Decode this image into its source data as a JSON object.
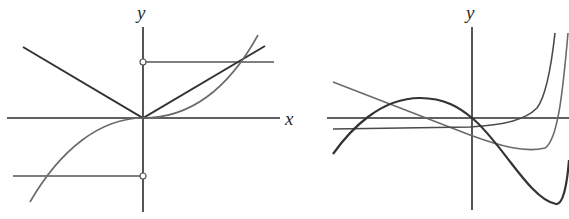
{
  "figures": [
    {
      "id": "left",
      "axis_labels": {
        "x": "x",
        "y": "y"
      },
      "curves": [
        {
          "name": "absolute-value",
          "description": "V-shaped graph with vertex at origin"
        },
        {
          "name": "cubic",
          "description": "increasing cubic through origin"
        },
        {
          "name": "step-upper",
          "description": "horizontal segment with open circle on y-axis, positive side"
        },
        {
          "name": "step-lower",
          "description": "horizontal segment with open circle on y-axis, negative side"
        }
      ]
    },
    {
      "id": "right",
      "axis_labels": {
        "y": "y"
      },
      "curves": [
        {
          "name": "curve-a",
          "description": "decreasing line-like curve with minimum then sharp rise"
        },
        {
          "name": "curve-b",
          "description": "nearly flat negative curve then sharp exponential rise"
        },
        {
          "name": "curve-c",
          "description": "cubic-like curve with local max left of y-axis and deep min right"
        }
      ]
    }
  ],
  "colors": {
    "axis": "#2b2b2b",
    "dark_curve": "#3a3a3a",
    "light_curve": "#6a6a6a",
    "background": "#ffffff"
  }
}
